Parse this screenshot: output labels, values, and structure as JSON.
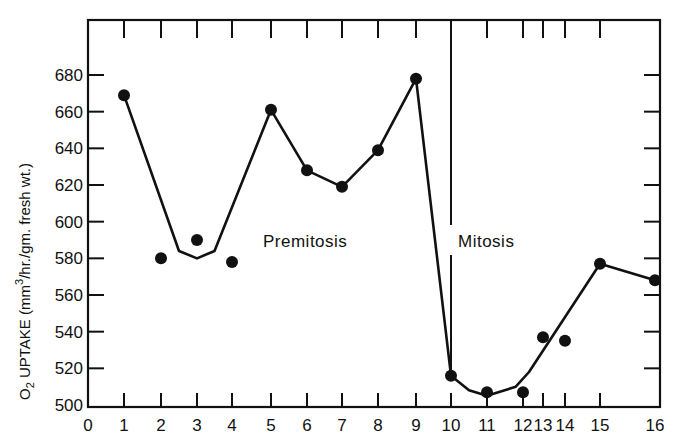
{
  "chart_data": {
    "type": "line",
    "title": "",
    "xlabel": "",
    "ylabel": "O2 UPTAKE (mm³/hr./gm. fresh wt.)",
    "ylabel_parts": {
      "o": "O",
      "sub": "2",
      "rest1": " UPTAKE  (mm",
      "sup": "3",
      "rest2": "/hr./gm. fresh wt.)"
    },
    "xlim": [
      0,
      16
    ],
    "ylim": [
      500,
      700
    ],
    "x_ticks": [
      {
        "value": 0,
        "label": "0"
      },
      {
        "value": 1,
        "label": "1"
      },
      {
        "value": 2,
        "label": "2"
      },
      {
        "value": 3,
        "label": "3"
      },
      {
        "value": 4,
        "label": "4"
      },
      {
        "value": 5,
        "label": "5"
      },
      {
        "value": 6,
        "label": "6"
      },
      {
        "value": 7,
        "label": "7"
      },
      {
        "value": 8,
        "label": "8"
      },
      {
        "value": 9,
        "label": "9"
      },
      {
        "value": 10,
        "label": "10"
      },
      {
        "value": 11,
        "label": "11"
      },
      {
        "value": 12,
        "label": "12"
      },
      {
        "value": 13,
        "label": "13"
      },
      {
        "value": 14,
        "label": "14"
      },
      {
        "value": 15,
        "label": "15"
      },
      {
        "value": 16,
        "label": "16"
      }
    ],
    "y_ticks": [
      500,
      520,
      540,
      560,
      580,
      600,
      620,
      640,
      660,
      680
    ],
    "grid": false,
    "legend": null,
    "points": [
      {
        "x": 1,
        "label": "1",
        "y": 669
      },
      {
        "x": 2,
        "label": "2",
        "y": 580
      },
      {
        "x": 3,
        "label": "3",
        "y": 590
      },
      {
        "x": 4,
        "label": "4",
        "y": 578
      },
      {
        "x": 5,
        "label": "5",
        "y": 661
      },
      {
        "x": 6,
        "label": "6",
        "y": 628
      },
      {
        "x": 7,
        "label": "7",
        "y": 619
      },
      {
        "x": 8,
        "label": "8",
        "y": 639
      },
      {
        "x": 9,
        "label": "9",
        "y": 678
      },
      {
        "x": 10,
        "label": "10",
        "y": 516
      },
      {
        "x": 11,
        "label": "11",
        "y": 507
      },
      {
        "x": 12,
        "label": "12",
        "y": 507
      },
      {
        "x": 13,
        "label": "13",
        "y": 537
      },
      {
        "x": 14,
        "label": "14",
        "y": 535
      },
      {
        "x": 15,
        "label": "15",
        "y": 577
      },
      {
        "x": 16,
        "label": "16",
        "y": 568
      }
    ],
    "fitted_curve": [
      {
        "x": 1,
        "y": 669
      },
      {
        "x": 2.5,
        "y": 584
      },
      {
        "x": 3,
        "y": 580
      },
      {
        "x": 3.5,
        "y": 584
      },
      {
        "x": 5,
        "y": 661
      },
      {
        "x": 6,
        "y": 628
      },
      {
        "x": 7,
        "y": 619
      },
      {
        "x": 8,
        "y": 639
      },
      {
        "x": 9,
        "y": 678
      },
      {
        "x": 10,
        "y": 516
      },
      {
        "x": 10.5,
        "y": 508
      },
      {
        "x": 11,
        "y": 505
      },
      {
        "x": 11.8,
        "y": 510
      },
      {
        "x": 12.3,
        "y": 518
      },
      {
        "x": 15,
        "y": 577
      },
      {
        "x": 16,
        "y": 568
      }
    ],
    "annotations": [
      {
        "text": "Premitosis",
        "x": 6.5,
        "y": 595
      },
      {
        "text": "Mitosis",
        "x": 11.2,
        "y": 595
      }
    ],
    "divider": {
      "x": 10,
      "label": "mitosis-boundary"
    }
  }
}
